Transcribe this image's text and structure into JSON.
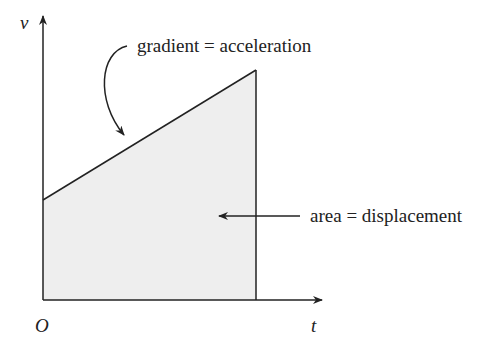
{
  "diagram": {
    "type": "velocity-time graph",
    "axes": {
      "y_label": "v",
      "x_label": "t",
      "origin_label": "O"
    },
    "annotations": {
      "gradient": "gradient = acceleration",
      "area": "area = displacement"
    },
    "colors": {
      "line": "#222222",
      "fill": "#eeeeee",
      "background": "#ffffff"
    }
  }
}
